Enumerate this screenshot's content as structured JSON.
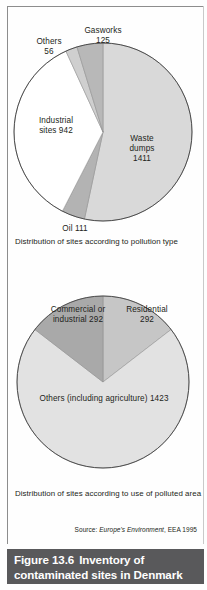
{
  "figure": {
    "number_label": "Figure 13.6",
    "title": "Inventory of",
    "title_line2": "contaminated sites in Denmark",
    "bar_color": "#59595b",
    "bar_text_color": "#ffffff"
  },
  "source": {
    "prefix": "Source:",
    "title": "Europe's Environment",
    "suffix": ", EEA 1995"
  },
  "captions": {
    "chart1": "Distribution of sites according to pollution type",
    "chart2": "Distribution of sites according to use of polluted area"
  },
  "chart_data": [
    {
      "type": "pie",
      "title": "Distribution of sites according to pollution type",
      "caption": "Distribution of sites according to pollution type",
      "units": "number of sites",
      "total": 2645,
      "start_angle_deg": 0,
      "direction": "clockwise",
      "categories": [
        "Waste dumps",
        "Oil",
        "Industrial sites",
        "Others",
        "Gasworks"
      ],
      "values": [
        1411,
        111,
        942,
        56,
        125
      ],
      "labels": [
        "Waste\ndumps\n1411",
        "Oil 111",
        "Industrial\nsites 942",
        "Others\n56",
        "Gasworks\n125"
      ],
      "colors": [
        "#d9d9d9",
        "#b3b3b3",
        "#ffffff",
        "#cfcfcf",
        "#b8b8b8"
      ],
      "slice_angles_deg": [
        192.1,
        15.1,
        128.2,
        7.6,
        17.0
      ],
      "outline_color": "#4d4d4d",
      "legend": "none"
    },
    {
      "type": "pie",
      "title": "Distribution of sites according to use of polluted area",
      "caption": "Distribution of sites according to use of polluted area",
      "units": "number of sites",
      "total": 2007,
      "start_angle_deg": 0,
      "direction": "clockwise",
      "categories": [
        "Residential",
        "Others (including agriculture)",
        "Commercial or industrial"
      ],
      "values": [
        292,
        1423,
        292
      ],
      "labels": [
        "Residential\n292",
        "Others (including agriculture) 1423",
        "Commercial or\nindustrial 292"
      ],
      "colors": [
        "#c6c6c6",
        "#e2e2e2",
        "#a9a9a9"
      ],
      "slice_angles_deg": [
        52.4,
        255.3,
        52.4
      ],
      "outline_color": "#4d4d4d",
      "legend": "none"
    }
  ]
}
